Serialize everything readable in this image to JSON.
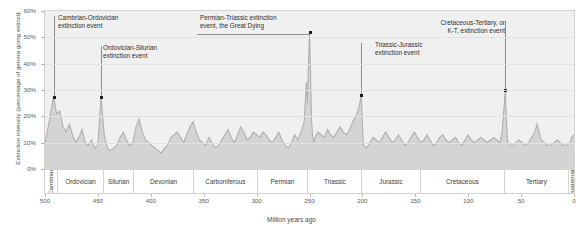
{
  "chart_data": {
    "type": "area",
    "title": "",
    "xlabel": "Million years ago",
    "ylabel": "Extinction intensity (percentage of genera going extinct)",
    "xlim": [
      500,
      0
    ],
    "ylim": [
      0,
      60
    ],
    "x_reversed": true,
    "grid": true,
    "legend": "none",
    "y_ticks": [
      "0%",
      "10%",
      "20%",
      "30%",
      "40%",
      "50%",
      "60%"
    ],
    "y_tick_values": [
      0,
      10,
      20,
      30,
      40,
      50,
      60
    ],
    "x_ticks": [
      "500",
      "450",
      "400",
      "350",
      "300",
      "250",
      "200",
      "150",
      "100",
      "50",
      "0"
    ],
    "x_tick_values": [
      500,
      450,
      400,
      350,
      300,
      250,
      200,
      150,
      100,
      50,
      0
    ],
    "series_name": "Extinction intensity",
    "area_fill_color": "#d4d4d4",
    "line_color": "#b4b4b4",
    "plot_background": "#f0f0f0",
    "points": [
      [
        500,
        10
      ],
      [
        496,
        18
      ],
      [
        492,
        27.5
      ],
      [
        489,
        21
      ],
      [
        486,
        22
      ],
      [
        483,
        16
      ],
      [
        480,
        14
      ],
      [
        477,
        17
      ],
      [
        474,
        13
      ],
      [
        471,
        10
      ],
      [
        468,
        12
      ],
      [
        465,
        15
      ],
      [
        462,
        10
      ],
      [
        459,
        9
      ],
      [
        456,
        11
      ],
      [
        453,
        8
      ],
      [
        450,
        9
      ],
      [
        447,
        27.5
      ],
      [
        444,
        13
      ],
      [
        441,
        8
      ],
      [
        438,
        7
      ],
      [
        435,
        8
      ],
      [
        432,
        9
      ],
      [
        429,
        12
      ],
      [
        426,
        14
      ],
      [
        423,
        11
      ],
      [
        420,
        9
      ],
      [
        417,
        10
      ],
      [
        414,
        16
      ],
      [
        411,
        19
      ],
      [
        408,
        14
      ],
      [
        405,
        11
      ],
      [
        402,
        10
      ],
      [
        399,
        9
      ],
      [
        396,
        8
      ],
      [
        393,
        7
      ],
      [
        390,
        6
      ],
      [
        387,
        8
      ],
      [
        384,
        9
      ],
      [
        381,
        12
      ],
      [
        378,
        13
      ],
      [
        375,
        14
      ],
      [
        372,
        12
      ],
      [
        369,
        10
      ],
      [
        366,
        13
      ],
      [
        363,
        16
      ],
      [
        360,
        18
      ],
      [
        357,
        14
      ],
      [
        354,
        11
      ],
      [
        351,
        10
      ],
      [
        348,
        9
      ],
      [
        345,
        12
      ],
      [
        342,
        10
      ],
      [
        339,
        8
      ],
      [
        336,
        9
      ],
      [
        333,
        11
      ],
      [
        330,
        13
      ],
      [
        327,
        15
      ],
      [
        324,
        12
      ],
      [
        321,
        10
      ],
      [
        318,
        13
      ],
      [
        315,
        16
      ],
      [
        312,
        14
      ],
      [
        309,
        11
      ],
      [
        306,
        12
      ],
      [
        303,
        14
      ],
      [
        300,
        13
      ],
      [
        297,
        12
      ],
      [
        294,
        14
      ],
      [
        291,
        13
      ],
      [
        288,
        11
      ],
      [
        285,
        10
      ],
      [
        282,
        12
      ],
      [
        279,
        14
      ],
      [
        276,
        11
      ],
      [
        273,
        9
      ],
      [
        270,
        8
      ],
      [
        267,
        10
      ],
      [
        264,
        13
      ],
      [
        261,
        11
      ],
      [
        258,
        14
      ],
      [
        255,
        18
      ],
      [
        253,
        33
      ],
      [
        252,
        25
      ],
      [
        251,
        40
      ],
      [
        250,
        52
      ],
      [
        249,
        36
      ],
      [
        248,
        18
      ],
      [
        247,
        12
      ],
      [
        246,
        10
      ],
      [
        245,
        12
      ],
      [
        242,
        14
      ],
      [
        239,
        13
      ],
      [
        236,
        12
      ],
      [
        233,
        15
      ],
      [
        230,
        13
      ],
      [
        227,
        12
      ],
      [
        224,
        14
      ],
      [
        221,
        16
      ],
      [
        218,
        14
      ],
      [
        215,
        13
      ],
      [
        212,
        15
      ],
      [
        209,
        18
      ],
      [
        206,
        20
      ],
      [
        203,
        24
      ],
      [
        201,
        28
      ],
      [
        200,
        17
      ],
      [
        199,
        9
      ],
      [
        196,
        8
      ],
      [
        193,
        10
      ],
      [
        190,
        12
      ],
      [
        187,
        11
      ],
      [
        184,
        10
      ],
      [
        181,
        12
      ],
      [
        178,
        14
      ],
      [
        175,
        12
      ],
      [
        172,
        10
      ],
      [
        169,
        11
      ],
      [
        166,
        13
      ],
      [
        163,
        11
      ],
      [
        160,
        9
      ],
      [
        157,
        10
      ],
      [
        154,
        12
      ],
      [
        151,
        14
      ],
      [
        148,
        12
      ],
      [
        145,
        10
      ],
      [
        142,
        11
      ],
      [
        139,
        13
      ],
      [
        136,
        11
      ],
      [
        133,
        9
      ],
      [
        130,
        10
      ],
      [
        127,
        12
      ],
      [
        124,
        13
      ],
      [
        121,
        11
      ],
      [
        118,
        10
      ],
      [
        115,
        11
      ],
      [
        112,
        12
      ],
      [
        109,
        10
      ],
      [
        106,
        9
      ],
      [
        103,
        11
      ],
      [
        100,
        13
      ],
      [
        97,
        11
      ],
      [
        94,
        10
      ],
      [
        91,
        11
      ],
      [
        88,
        12
      ],
      [
        85,
        11
      ],
      [
        82,
        10
      ],
      [
        79,
        11
      ],
      [
        76,
        12
      ],
      [
        73,
        11
      ],
      [
        70,
        10
      ],
      [
        68,
        14
      ],
      [
        66,
        24
      ],
      [
        65,
        30
      ],
      [
        64,
        20
      ],
      [
        63,
        11
      ],
      [
        61,
        9
      ],
      [
        58,
        9
      ],
      [
        55,
        10
      ],
      [
        52,
        11
      ],
      [
        49,
        10
      ],
      [
        46,
        9
      ],
      [
        43,
        10
      ],
      [
        40,
        12
      ],
      [
        37,
        14
      ],
      [
        35,
        17
      ],
      [
        33,
        14
      ],
      [
        31,
        11
      ],
      [
        28,
        10
      ],
      [
        25,
        9
      ],
      [
        22,
        9
      ],
      [
        19,
        10
      ],
      [
        16,
        11
      ],
      [
        13,
        10
      ],
      [
        10,
        9
      ],
      [
        7,
        9
      ],
      [
        4,
        10
      ],
      [
        2,
        12
      ],
      [
        0,
        13
      ]
    ],
    "periods": [
      {
        "name": "Cambrian",
        "start": 500,
        "end": 488,
        "vertical": true
      },
      {
        "name": "Ordovician",
        "start": 488,
        "end": 444,
        "vertical": false
      },
      {
        "name": "Silurian",
        "start": 444,
        "end": 416,
        "vertical": false
      },
      {
        "name": "Devonian",
        "start": 416,
        "end": 359,
        "vertical": false
      },
      {
        "name": "Carboniferous",
        "start": 359,
        "end": 299,
        "vertical": false
      },
      {
        "name": "Permian",
        "start": 299,
        "end": 251,
        "vertical": false
      },
      {
        "name": "Triassic",
        "start": 251,
        "end": 200,
        "vertical": false
      },
      {
        "name": "Jurassic",
        "start": 200,
        "end": 145,
        "vertical": false
      },
      {
        "name": "Cretaceous",
        "start": 145,
        "end": 65,
        "vertical": false
      },
      {
        "name": "Tertiary",
        "start": 65,
        "end": 5,
        "vertical": false
      },
      {
        "name": "Quaternary",
        "start": 5,
        "end": 0,
        "vertical": true
      }
    ],
    "annotations": [
      {
        "id": "cambrian-ordovician",
        "text": "Cambrian-Ordovician\nextinction event",
        "x": 492,
        "y": 27.5
      },
      {
        "id": "ordovician-silurian",
        "text": "Ordovician-Silurian\nextinction event",
        "x": 447,
        "y": 27.5
      },
      {
        "id": "permian-triassic",
        "text": "Permian-Triassic extinction\nevent, the Great Dying",
        "x": 250,
        "y": 52
      },
      {
        "id": "triassic-jurassic",
        "text": "Triassic-Jurassic\nextinction event",
        "x": 201,
        "y": 28
      },
      {
        "id": "cretaceous-tertiary",
        "text": "Cretaceous-Tertiary, or\nK-T, extinction event",
        "x": 65,
        "y": 30
      }
    ]
  }
}
